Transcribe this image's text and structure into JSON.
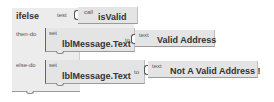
{
  "ifelse_block": {
    "keyword": "ifelse",
    "test_label": "test",
    "then_label": "then-do",
    "else_label": "else-do"
  },
  "test_block": {
    "call_label": "call",
    "procedure": "isValid"
  },
  "then_block": {
    "set_label": "set",
    "property": "lblMessage.Text",
    "to_label": "to",
    "text_label": "text",
    "value": "Valid Address"
  },
  "else_block": {
    "set_label": "set",
    "property": "lblMessage.Text",
    "to_label": "to",
    "text_label": "text",
    "value": "Not A Valid Address !"
  },
  "colors": {
    "block_fill": "#ececec",
    "block_border": "#666666",
    "text": "#333333"
  }
}
